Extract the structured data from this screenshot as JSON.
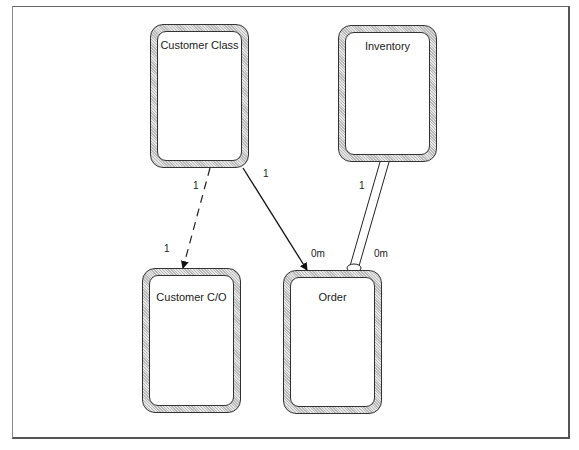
{
  "diagram": {
    "classes": [
      {
        "id": "customer-class",
        "label": "Customer Class"
      },
      {
        "id": "inventory",
        "label": "Inventory"
      },
      {
        "id": "customer-co",
        "label": "Customer C/O"
      },
      {
        "id": "order",
        "label": "Order"
      }
    ],
    "relationships": [
      {
        "from": "Customer Class",
        "to": "Customer C/O",
        "style": "dashed-arrow",
        "from_mult": "1",
        "to_mult": "1"
      },
      {
        "from": "Customer Class",
        "to": "Order",
        "style": "solid-arrow",
        "from_mult": "1",
        "to_mult": "0m"
      },
      {
        "from": "Inventory",
        "to": "Order",
        "style": "double-line-aggregation",
        "from_mult": "1",
        "to_mult": "0m"
      }
    ]
  }
}
